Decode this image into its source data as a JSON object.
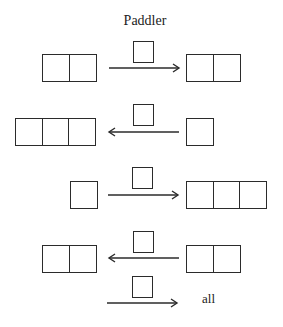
{
  "diagram": {
    "title": "Paddler",
    "rows": [
      {
        "left_cells": 2,
        "direction": "right",
        "token": 1,
        "right_cells": 2,
        "right_label": ""
      },
      {
        "left_cells": 3,
        "direction": "left",
        "token": 1,
        "right_cells": 1,
        "right_label": ""
      },
      {
        "left_cells": 1,
        "direction": "right",
        "token": 1,
        "right_cells": 3,
        "right_label": ""
      },
      {
        "left_cells": 2,
        "direction": "left",
        "token": 1,
        "right_cells": 2,
        "right_label": ""
      },
      {
        "left_cells": 0,
        "direction": "right",
        "token": 1,
        "right_cells": 0,
        "right_label": "all"
      }
    ],
    "colors": {
      "stroke": "#2b2b2b",
      "background": "#ffffff"
    }
  }
}
